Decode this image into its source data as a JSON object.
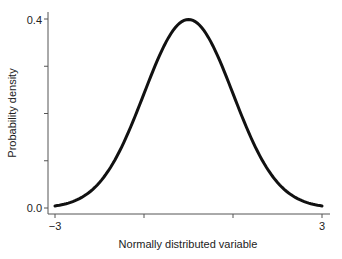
{
  "chart_data": {
    "type": "line",
    "title": "",
    "xlabel": "Normally distributed variable",
    "ylabel": "Probability density",
    "xlim": [
      -3,
      3
    ],
    "ylim": [
      0.0,
      0.4
    ],
    "x_ticks": [
      -3,
      -1,
      1,
      3
    ],
    "x_tick_labels": [
      "−3",
      "",
      "",
      "3"
    ],
    "y_ticks": [
      0.0,
      0.1,
      0.2,
      0.3,
      0.4
    ],
    "y_tick_labels": [
      "0.0",
      "",
      "",
      "",
      "0.4"
    ],
    "grid": false,
    "legend": null,
    "series": [
      {
        "name": "Standard normal density",
        "x": [
          -3,
          -2.5,
          -2,
          -1.5,
          -1,
          -0.5,
          0,
          0.5,
          1,
          1.5,
          2,
          2.5,
          3
        ],
        "values": [
          0.004,
          0.018,
          0.054,
          0.13,
          0.242,
          0.352,
          0.399,
          0.352,
          0.242,
          0.13,
          0.054,
          0.018,
          0.004
        ]
      }
    ]
  },
  "labels": {
    "xlabel": "Normally distributed variable",
    "ylabel": "Probability density",
    "x_min": "−3",
    "x_max": "3",
    "y_min": "0.0",
    "y_max": "0.4"
  }
}
